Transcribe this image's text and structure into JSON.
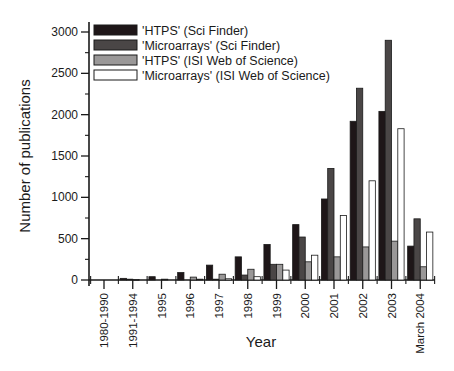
{
  "chart_data": {
    "type": "bar",
    "title": "",
    "xlabel": "Year",
    "ylabel": "Number of publications",
    "ylim": [
      0,
      3000
    ],
    "yticks": [
      0,
      500,
      1000,
      1500,
      2000,
      2500,
      3000
    ],
    "grid": false,
    "legend_position": "top-left",
    "categories": [
      "1980-1990",
      "1991-1994",
      "1995",
      "1996",
      "1997",
      "1998",
      "1999",
      "2000",
      "2001",
      "2002",
      "2003",
      "March 2004"
    ],
    "series": [
      {
        "name": "'HTPS' (Sci Finder)",
        "color": "#1e1618",
        "values": [
          0,
          20,
          40,
          90,
          180,
          280,
          430,
          670,
          980,
          1920,
          2040,
          410
        ]
      },
      {
        "name": "'Microarrays' (Sci Finder)",
        "color": "#4a4646",
        "values": [
          0,
          10,
          0,
          0,
          10,
          60,
          190,
          520,
          1350,
          2320,
          2900,
          740
        ]
      },
      {
        "name": "'HTPS' (ISI Web of Science)",
        "color": "#9a9898",
        "values": [
          0,
          5,
          10,
          35,
          70,
          130,
          190,
          220,
          280,
          400,
          470,
          160
        ]
      },
      {
        "name": "'Microarrays' (ISI Web of Science)",
        "color": "#ffffff",
        "values": [
          0,
          0,
          0,
          10,
          15,
          40,
          120,
          300,
          780,
          1200,
          1830,
          580
        ]
      }
    ]
  }
}
